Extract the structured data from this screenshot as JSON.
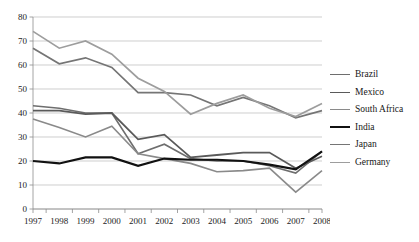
{
  "chart_data": {
    "type": "line",
    "title": "",
    "subtitle": "",
    "xlabel": "",
    "ylabel": "",
    "x": [
      1997,
      1998,
      1999,
      2000,
      2001,
      2002,
      2003,
      2004,
      2005,
      2006,
      2007,
      2008
    ],
    "xtick_labels": [
      "1997",
      "1998",
      "1999",
      "2000",
      "2001",
      "2002",
      "2003",
      "2004",
      "2005",
      "2006",
      "2007",
      "2008"
    ],
    "ytick_labels": [
      "0",
      "10",
      "20",
      "30",
      "40",
      "50",
      "60",
      "70",
      "80"
    ],
    "ylim": [
      0,
      80
    ],
    "ytick_step": 10,
    "grid": "horizontal",
    "legend_position": "right",
    "series": [
      {
        "name": "Brazil",
        "color": "#6e6e6e",
        "width": 1.6,
        "values": [
          43,
          42,
          40,
          40,
          23,
          27,
          21,
          20,
          20,
          18,
          15,
          24
        ]
      },
      {
        "name": "Mexico",
        "color": "#5a5a5a",
        "width": 1.8,
        "values": [
          41,
          41,
          39.5,
          40,
          29,
          31,
          21.5,
          22.5,
          23.5,
          23.5,
          17,
          22
        ]
      },
      {
        "name": "South Africa",
        "color": "#8a8a8a",
        "width": 1.6,
        "values": [
          37.5,
          34,
          30,
          34.5,
          23,
          21,
          19,
          15.5,
          16,
          17,
          7,
          16
        ]
      },
      {
        "name": "India",
        "color": "#111111",
        "width": 2.1,
        "values": [
          20,
          19,
          21.5,
          21.5,
          18,
          21,
          20.5,
          20.5,
          20,
          18.5,
          16.5,
          24
        ]
      },
      {
        "name": "Japan",
        "color": "#757575",
        "width": 1.7,
        "values": [
          67,
          60.5,
          63,
          59,
          48.5,
          48.5,
          47.5,
          43,
          46.5,
          43,
          38,
          41
        ]
      },
      {
        "name": "Germany",
        "color": "#9d9d9d",
        "width": 1.7,
        "values": [
          74,
          67,
          70,
          64.5,
          54.5,
          49,
          39.5,
          44,
          47.5,
          42,
          38.5,
          44
        ]
      }
    ]
  }
}
